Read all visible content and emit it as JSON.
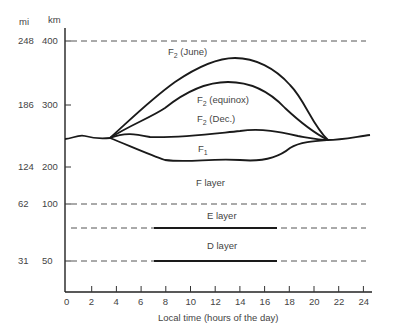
{
  "chart_data": {
    "type": "line",
    "title": "",
    "xlabel": "Local time (hours of the day)",
    "ylabel_left": "mi",
    "ylabel_right": "km",
    "x_ticks": [
      0,
      2,
      4,
      6,
      8,
      10,
      12,
      14,
      16,
      18,
      20,
      22,
      24
    ],
    "xlim": [
      0,
      24
    ],
    "y_ticks_km": [
      400,
      300,
      200,
      100,
      50
    ],
    "y_ticks_mi": [
      248,
      186,
      124,
      62,
      31
    ],
    "reference_lines_dashed_km": [
      400,
      100,
      75,
      50
    ],
    "series": [
      {
        "name": "F2 (June)",
        "x": [
          3.5,
          6,
          8,
          10,
          12,
          13.5,
          15,
          17,
          19,
          21
        ],
        "y_km": [
          250,
          290,
          330,
          370,
          395,
          400,
          395,
          370,
          320,
          250
        ]
      },
      {
        "name": "F2 (equinox)",
        "x": [
          3.5,
          6,
          8,
          10,
          12,
          13.5,
          15,
          17,
          19,
          21
        ],
        "y_km": [
          250,
          270,
          300,
          340,
          360,
          362,
          355,
          335,
          300,
          250
        ]
      },
      {
        "name": "F2 (Dec.)",
        "x": [
          3.5,
          5,
          7,
          10,
          13,
          15,
          17,
          19,
          21
        ],
        "y_km": [
          250,
          255,
          248,
          250,
          255,
          258,
          255,
          250,
          247
        ]
      },
      {
        "name": "F1",
        "x": [
          3.5,
          6,
          8,
          10,
          12,
          14,
          16,
          18,
          19,
          21
        ],
        "y_km": [
          250,
          235,
          210,
          200,
          203,
          200,
          205,
          225,
          240,
          247
        ]
      },
      {
        "name": "F layer (night)",
        "x": [
          0,
          1,
          2,
          3,
          3.5,
          21,
          22,
          24
        ],
        "y_km": [
          250,
          248,
          253,
          249,
          250,
          247,
          250,
          255
        ]
      },
      {
        "name": "E layer",
        "x": [
          7,
          17
        ],
        "y_km": [
          75,
          75
        ]
      },
      {
        "name": "D layer",
        "x": [
          7,
          17
        ],
        "y_km": [
          50,
          50
        ]
      }
    ],
    "annotations": [
      "F2 (June)",
      "F2 (equinox)",
      "F2 (Dec.)",
      "F1",
      "F layer",
      "E layer",
      "D layer"
    ],
    "grid": false,
    "legend": "inline labels"
  },
  "labels": {
    "mi": "mi",
    "km": "km",
    "xlabel": "Local time (hours of the day)",
    "f2_june": "F",
    "f2_june_sub": "2",
    "f2_june_rest": " (June)",
    "f2_equinox_rest": " (equinox)",
    "f2_dec_rest": " (Dec.)",
    "f1": "F",
    "f1_sub": "1",
    "f_layer": "F layer",
    "e_layer": "E layer",
    "d_layer": "D layer"
  }
}
